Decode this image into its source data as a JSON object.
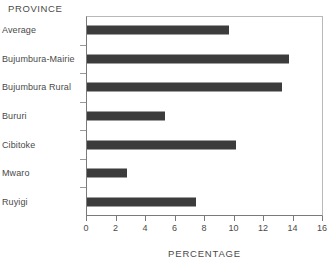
{
  "chart_data": {
    "type": "bar",
    "orientation": "horizontal",
    "title": "PROVINCE",
    "xlabel": "PERCENTAGE",
    "ylabel": "",
    "categories": [
      "Average",
      "Bujumbura-Mairie",
      "Bujumbura Rural",
      "Bururi",
      "Cibitoke",
      "Mwaro",
      "Ruyigi"
    ],
    "values": [
      9.6,
      13.7,
      13.2,
      5.3,
      10.1,
      2.7,
      7.4
    ],
    "xlim": [
      0,
      16
    ],
    "xticks": [
      0,
      2,
      4,
      6,
      8,
      10,
      12,
      14,
      16
    ],
    "xtick_labels": [
      "0",
      "2",
      "4",
      "6",
      "8",
      "10",
      "12",
      "14",
      "16"
    ],
    "grid": false,
    "legend": null,
    "bar_color": "#3c3c3c",
    "axis_color": "#7a7a7a",
    "frame_color": "#b8b8b8",
    "text_color": "#4a4a4a"
  }
}
